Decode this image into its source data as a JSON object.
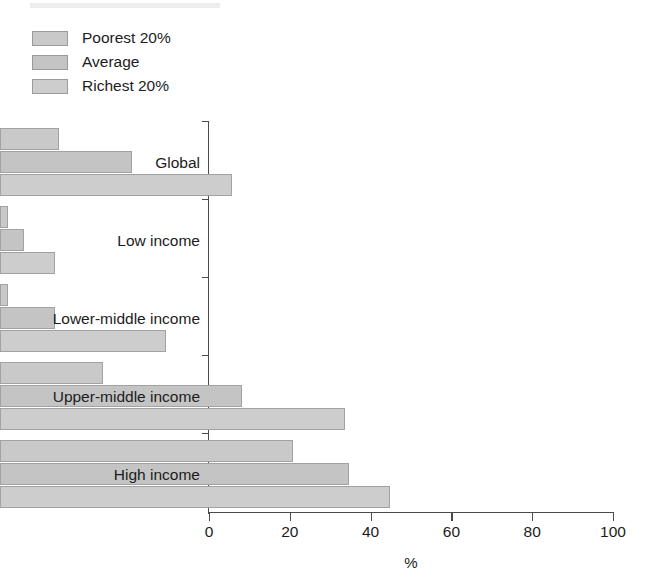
{
  "legend": {
    "items": [
      {
        "label": "Poorest 20%",
        "color": "#c9c9c9"
      },
      {
        "label": "Average",
        "color": "#c4c4c4"
      },
      {
        "label": "Richest 20%",
        "color": "#cdcdcd"
      }
    ]
  },
  "axis": {
    "x_title": "%",
    "x_ticks": [
      "0",
      "20",
      "40",
      "60",
      "80",
      "100"
    ]
  },
  "categories": [
    "Global",
    "Low income",
    "Lower-middle income",
    "Upper-middle income",
    "High income"
  ],
  "chart_data": {
    "type": "bar",
    "orientation": "horizontal",
    "title": "",
    "subtitle": "",
    "xlabel": "%",
    "ylabel": "",
    "xlim": [
      0,
      100
    ],
    "xticks": [
      0,
      20,
      40,
      60,
      80,
      100
    ],
    "grid": false,
    "legend_position": "top-left",
    "categories": [
      "Global",
      "Low income",
      "Lower-middle income",
      "Upper-middle income",
      "High income"
    ],
    "series": [
      {
        "name": "Poorest 20%",
        "color": "#c9c9c9",
        "values": [
          14.6,
          2.0,
          2.0,
          25.5,
          72.5
        ]
      },
      {
        "name": "Average",
        "color": "#c4c4c4",
        "values": [
          32.7,
          6.0,
          13.5,
          60.0,
          86.5
        ]
      },
      {
        "name": "Richest 20%",
        "color": "#cdcdcd",
        "values": [
          57.4,
          13.5,
          41.0,
          85.5,
          96.5
        ]
      }
    ]
  }
}
